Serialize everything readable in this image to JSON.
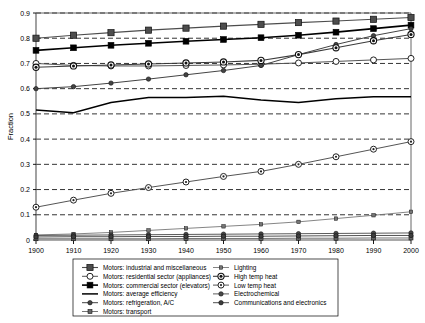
{
  "chart_data": {
    "type": "line",
    "title": "",
    "xlabel": "",
    "ylabel": "Fraction",
    "xlim": [
      1900,
      2000
    ],
    "ylim": [
      0,
      0.9
    ],
    "grid": true,
    "legend_position": "below",
    "xticks": [
      1900,
      1910,
      1920,
      1930,
      1940,
      1950,
      1960,
      1970,
      1980,
      1990,
      2000
    ],
    "yticks": [
      "0",
      "0.1",
      "0.2",
      "0.3",
      "0.4",
      "0.5",
      "0.6",
      "0.7",
      "0.8",
      "0.9"
    ],
    "x": [
      1900,
      1910,
      1920,
      1930,
      1940,
      1950,
      1960,
      1970,
      1980,
      1990,
      2000
    ],
    "series": [
      {
        "name": "Motors: industrial and miscellaneous",
        "marker": "filled-square",
        "color": "#4d4d4d",
        "linewidth": 1.1,
        "values": [
          0.8,
          0.812,
          0.822,
          0.832,
          0.84,
          0.848,
          0.855,
          0.862,
          0.868,
          0.875,
          0.882
        ]
      },
      {
        "name": "Motors: residential sector (appliances)",
        "marker": "open-circle",
        "color": "#555555",
        "linewidth": 1.0,
        "values": [
          0.7,
          0.692,
          0.69,
          0.69,
          0.692,
          0.694,
          0.697,
          0.702,
          0.708,
          0.714,
          0.72
        ]
      },
      {
        "name": "Motors: commercial sector (elevators)",
        "marker": "filled-diamond",
        "color": "#000000",
        "linewidth": 1.6,
        "values": [
          0.752,
          0.762,
          0.772,
          0.78,
          0.788,
          0.795,
          0.802,
          0.812,
          0.824,
          0.838,
          0.852
        ]
      },
      {
        "name": "Motors: average efficiency",
        "marker": "none",
        "color": "#000000",
        "linewidth": 1.5,
        "values": [
          0.515,
          0.505,
          0.545,
          0.565,
          0.565,
          0.57,
          0.555,
          0.545,
          0.56,
          0.568,
          0.568
        ]
      },
      {
        "name": "Motors: refrigeration, A/C",
        "marker": "small-filled-circle",
        "color": "#444444",
        "linewidth": 1.0,
        "values": [
          0.6,
          0.608,
          0.622,
          0.638,
          0.655,
          0.672,
          0.692,
          0.735,
          0.775,
          0.81,
          0.838
        ]
      },
      {
        "name": "Motors: transport",
        "marker": "small-filled-square",
        "color": "#666666",
        "linewidth": 0.9,
        "values": [
          0.005,
          0.005,
          0.005,
          0.005,
          0.006,
          0.006,
          0.006,
          0.007,
          0.007,
          0.008,
          0.008
        ]
      },
      {
        "name": "Lighting",
        "marker": "tiny-filled-square",
        "color": "#777777",
        "linewidth": 0.9,
        "values": [
          0.02,
          0.024,
          0.03,
          0.038,
          0.046,
          0.054,
          0.062,
          0.072,
          0.085,
          0.098,
          0.112
        ]
      },
      {
        "name": "High temp heat",
        "marker": "bullseye",
        "color": "#3a3a3a",
        "linewidth": 1.1,
        "values": [
          0.685,
          0.69,
          0.694,
          0.698,
          0.702,
          0.706,
          0.712,
          0.735,
          0.762,
          0.79,
          0.815
        ]
      },
      {
        "name": "Low temp heat",
        "marker": "open-circle-dot",
        "color": "#555555",
        "linewidth": 1.0,
        "values": [
          0.13,
          0.158,
          0.185,
          0.208,
          0.23,
          0.252,
          0.272,
          0.3,
          0.33,
          0.36,
          0.39
        ]
      },
      {
        "name": "Electrochemical",
        "marker": "small-filled-circle",
        "color": "#4a4a4a",
        "linewidth": 0.9,
        "values": [
          0.018,
          0.019,
          0.02,
          0.021,
          0.022,
          0.023,
          0.024,
          0.025,
          0.026,
          0.027,
          0.028
        ]
      },
      {
        "name": "Communications and electronics",
        "marker": "small-filled-circle",
        "color": "#3d3d3d",
        "linewidth": 0.9,
        "values": [
          0.012,
          0.013,
          0.013,
          0.014,
          0.014,
          0.015,
          0.015,
          0.016,
          0.017,
          0.018,
          0.018
        ]
      }
    ]
  },
  "legend": {
    "column_left": [
      "Motors: industrial and miscellaneous",
      "Motors: residential sector (appliances)",
      "Motors: commercial sector (elevators)",
      "Motors: average efficiency",
      "Motors: refrigeration, A/C",
      "Motors: transport"
    ],
    "column_right": [
      "Lighting",
      "High temp heat",
      "Low temp heat",
      "Electrochemical",
      "Communications and electronics"
    ]
  }
}
